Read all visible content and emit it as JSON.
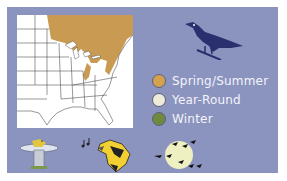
{
  "colors": {
    "panel_bg": "#8b93bf",
    "map_bg": "#ffffff",
    "range_fill": "#c99a52",
    "bird_silhouette": "#2a2f6e"
  },
  "bird_icon": "bird-silhouette-icon",
  "legend": {
    "items": [
      {
        "label": "Spring/Summer",
        "color": "#d4a24f"
      },
      {
        "label": "Year-Round",
        "color": "#eeecd8"
      },
      {
        "label": "Winter",
        "color": "#6f8a3f"
      }
    ]
  },
  "footer_icons": [
    {
      "name": "birdbath-icon"
    },
    {
      "name": "singing-bird-icon"
    },
    {
      "name": "migration-moon-icon"
    }
  ]
}
